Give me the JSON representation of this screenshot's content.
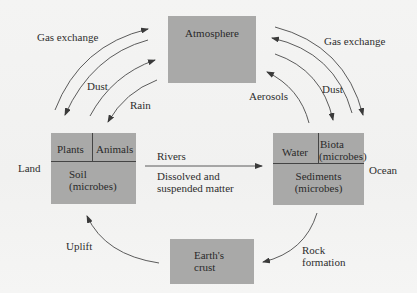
{
  "diagram": {
    "nodes": {
      "atmosphere": {
        "label": "Atmosphere"
      },
      "land": {
        "side_label": "Land",
        "cells": {
          "plants": "Plants",
          "animals": "Animals",
          "soil_line1": "Soil",
          "soil_line2": "(microbes)"
        }
      },
      "ocean": {
        "side_label": "Ocean",
        "cells": {
          "water": "Water",
          "biota_line1": "Biota",
          "biota_line2": "(microbes)",
          "sediments_line1": "Sediments",
          "sediments_line2": "(microbes)"
        }
      },
      "crust": {
        "line1": "Earth's",
        "line2": "crust"
      }
    },
    "flows": {
      "left_gas_exchange": "Gas exchange",
      "left_dust": "Dust",
      "rain": "Rain",
      "right_gas_exchange": "Gas exchange",
      "right_dust": "Dust",
      "aerosols": "Aerosols",
      "rivers": "Rivers",
      "rivers_sub_line1": "Dissolved and",
      "rivers_sub_line2": "suspended matter",
      "uplift": "Uplift",
      "rock_formation_line1": "Rock",
      "rock_formation_line2": "formation"
    },
    "colors": {
      "box": "#a9a9a8",
      "background": "#f3f3f2",
      "line": "#3a3a3a"
    }
  }
}
